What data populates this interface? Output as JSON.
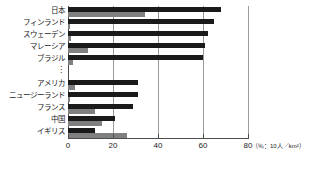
{
  "chart_data": {
    "type": "bar",
    "orientation": "horizontal",
    "title": "",
    "xlabel": "",
    "ylabel": "",
    "unit_note": "（％：10人／km²）",
    "xlim": [
      0,
      80
    ],
    "xticks": [
      0,
      20,
      40,
      60,
      80
    ],
    "xticklabels": [
      "0",
      "20",
      "40",
      "60",
      "80"
    ],
    "grid": true,
    "grid_axis": "x",
    "legend_position": "none",
    "break_marker": "⋮",
    "break_after_index": 4,
    "categories": [
      "日本",
      "フィンランド",
      "スウェーデン",
      "マレーシア",
      "ブラジル",
      "アメリカ",
      "ニュージーランド",
      "フランス",
      "中国",
      "イギリス"
    ],
    "series": [
      {
        "name": "series-1",
        "color": "#1a1a1a",
        "values": [
          68,
          65,
          62,
          61,
          60,
          31,
          31,
          29,
          21,
          12
        ]
      },
      {
        "name": "series-2",
        "color": "#808080",
        "values": [
          34,
          1,
          1.5,
          9,
          2,
          3,
          1,
          12,
          15,
          26
        ]
      }
    ]
  },
  "colors": {
    "series_1": "#1a1a1a",
    "series_2": "#808080",
    "gridline": "#9a9a9a",
    "axis": "#4d4d4d",
    "background": "#ffffff",
    "text": "#1a1a1a"
  }
}
